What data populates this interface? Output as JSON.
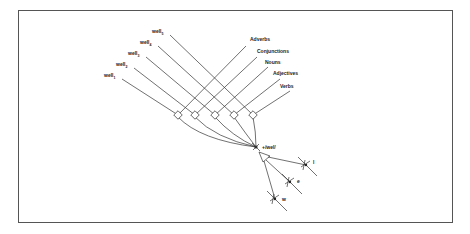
{
  "diagram": {
    "word_nodes": [
      {
        "label": "well",
        "sub": "5"
      },
      {
        "label": "well",
        "sub": "4"
      },
      {
        "label": "well",
        "sub": "3"
      },
      {
        "label": "well",
        "sub": "2"
      },
      {
        "label": "well",
        "sub": "1"
      }
    ],
    "category_nodes": [
      "Adverbs",
      "Conjunctions",
      "Nouns",
      "Adjectives",
      "Verbs"
    ],
    "convergence_label": "+/wel/",
    "phoneme_nodes": [
      "l",
      "e",
      "w"
    ]
  }
}
